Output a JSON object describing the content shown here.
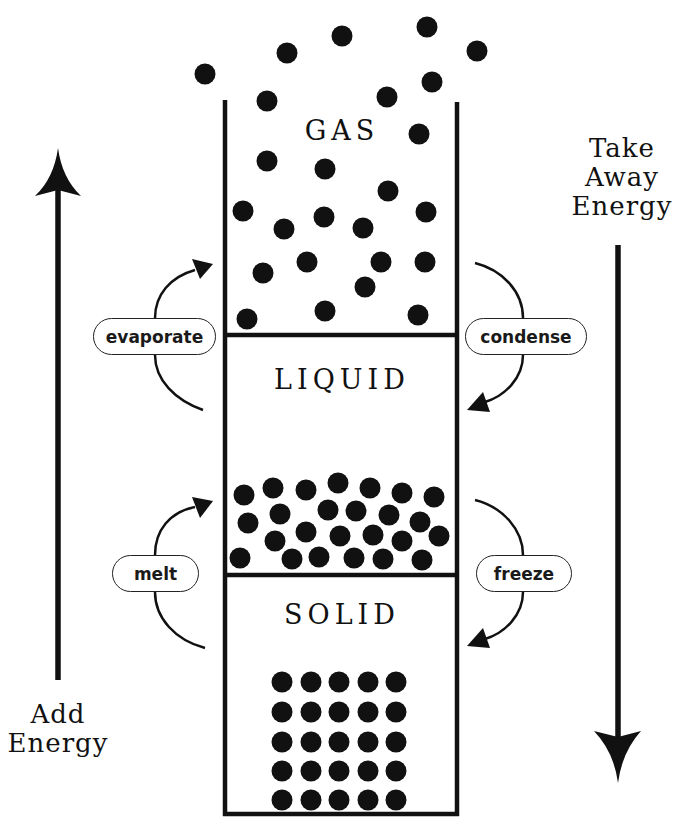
{
  "diagram": {
    "colors": {
      "ink": "#111111",
      "background": "#ffffff"
    },
    "states": [
      {
        "id": "gas",
        "label": "GAS"
      },
      {
        "id": "liquid",
        "label": "LIQUID"
      },
      {
        "id": "solid",
        "label": "SOLID"
      }
    ],
    "transitions": [
      {
        "id": "evaporate",
        "label": "evaporate",
        "from": "liquid",
        "to": "gas",
        "direction": "up"
      },
      {
        "id": "condense",
        "label": "condense",
        "from": "gas",
        "to": "liquid",
        "direction": "down"
      },
      {
        "id": "melt",
        "label": "melt",
        "from": "solid",
        "to": "liquid",
        "direction": "up"
      },
      {
        "id": "freeze",
        "label": "freeze",
        "from": "liquid",
        "to": "solid",
        "direction": "down"
      }
    ],
    "energy_axes": {
      "add": {
        "line1": "Add",
        "line2": "Energy",
        "direction": "up"
      },
      "take_away": {
        "line1": "Take",
        "line2": "Away",
        "line3": "Energy",
        "direction": "down"
      }
    },
    "particles": {
      "radius": 10.5,
      "gas": [
        [
          205,
          74
        ],
        [
          287,
          53
        ],
        [
          342,
          36
        ],
        [
          427,
          27
        ],
        [
          477,
          51
        ],
        [
          267,
          101
        ],
        [
          387,
          97
        ],
        [
          432,
          82
        ],
        [
          419,
          134
        ],
        [
          267,
          161
        ],
        [
          325,
          169
        ],
        [
          388,
          191
        ],
        [
          243,
          211
        ],
        [
          284,
          229
        ],
        [
          324,
          217
        ],
        [
          363,
          228
        ],
        [
          426,
          212
        ],
        [
          307,
          262
        ],
        [
          263,
          273
        ],
        [
          381,
          262
        ],
        [
          425,
          262
        ],
        [
          365,
          287
        ],
        [
          247,
          319
        ],
        [
          325,
          311
        ],
        [
          418,
          315
        ]
      ],
      "liquid": [
        [
          244,
          495
        ],
        [
          273,
          488
        ],
        [
          306,
          490
        ],
        [
          338,
          483
        ],
        [
          370,
          488
        ],
        [
          402,
          493
        ],
        [
          434,
          497
        ],
        [
          280,
          514
        ],
        [
          248,
          523
        ],
        [
          328,
          510
        ],
        [
          356,
          511
        ],
        [
          389,
          515
        ],
        [
          420,
          522
        ],
        [
          306,
          532
        ],
        [
          275,
          541
        ],
        [
          340,
          536
        ],
        [
          373,
          535
        ],
        [
          402,
          541
        ],
        [
          439,
          536
        ],
        [
          240,
          558
        ],
        [
          292,
          559
        ],
        [
          319,
          557
        ],
        [
          354,
          558
        ],
        [
          383,
          559
        ],
        [
          422,
          560
        ]
      ],
      "solid": {
        "columns_x": [
          282,
          311,
          339,
          368,
          396
        ],
        "rows_y": [
          682,
          712,
          742,
          771,
          800
        ]
      }
    }
  }
}
